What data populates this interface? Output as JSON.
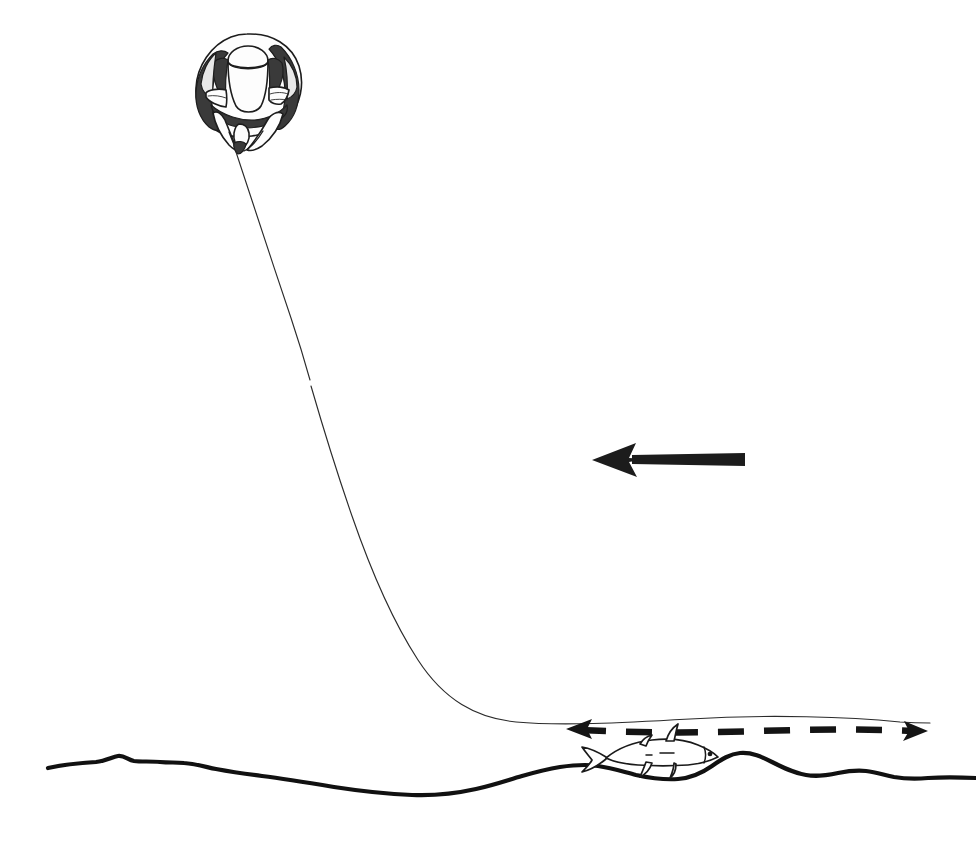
{
  "figure": {
    "title": "Trawl kite and ground line diagram",
    "caption": "",
    "background_color": "#ffffff",
    "ink_color": "#1a1a1a",
    "width": 976,
    "height": 841
  },
  "elements": {
    "kite": {
      "name": "trawl-kite",
      "label": "",
      "center_x": 247,
      "center_y": 88,
      "attach_x": 236,
      "attach_y": 150
    },
    "tow_line": {
      "name": "tow-line",
      "label": "",
      "start_x": 236,
      "start_y": 150,
      "end_x": 930,
      "end_y": 722
    },
    "current_arrow": {
      "name": "current-direction-arrow",
      "label": "",
      "direction": "left",
      "tip_x": 592,
      "tip_y": 460,
      "tail_x": 745,
      "tail_y": 460,
      "color": "#1c1c1c"
    },
    "sweep_arrow": {
      "name": "sweep-double-arrow",
      "label": "",
      "direction": "double",
      "left_tip_x": 566,
      "left_tip_y": 729,
      "right_tip_x": 928,
      "right_tip_y": 731,
      "style": "dashed",
      "color": "#141414"
    },
    "fish": {
      "name": "fish",
      "label": "",
      "facing": "left",
      "x": 600,
      "y": 748,
      "length": 112
    },
    "seabed": {
      "name": "seabed-contour",
      "label": "",
      "start_x": 48,
      "start_y": 768,
      "end_x": 976,
      "end_y": 779,
      "color": "#111111"
    }
  }
}
